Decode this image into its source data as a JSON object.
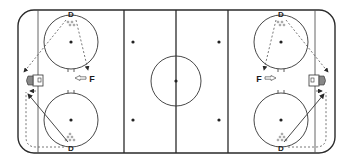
{
  "diagram": {
    "type": "hockey-rink-drill",
    "colors": {
      "line": "#2a2a2a",
      "dashed": "#555555",
      "background": "#ffffff"
    },
    "players": {
      "left_top_d": "D",
      "left_bottom_d": "D",
      "right_top_d": "D",
      "right_bottom_d": "D",
      "left_f": "F",
      "right_f": "F"
    },
    "markers": {
      "pucks": "puck-pile",
      "goal": "net"
    }
  }
}
